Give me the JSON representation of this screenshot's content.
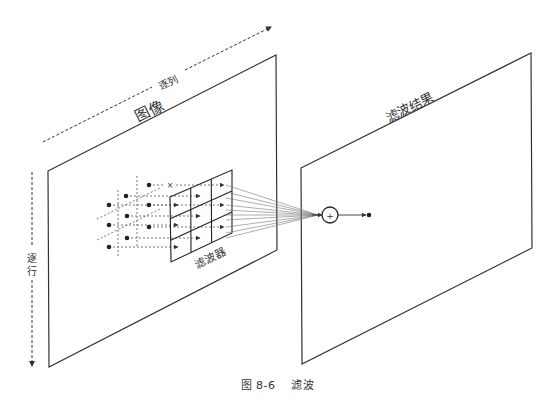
{
  "diagram": {
    "title": "滤波",
    "figure_number": "图 8-6",
    "caption": "图 8-6    滤波",
    "labels": {
      "column_scan": "逐列",
      "row_scan": "逐行",
      "input_plane": "图像",
      "filter": "滤波器",
      "output_plane": "滤波结果",
      "sum_symbol": "+",
      "skipped_marker": "×"
    },
    "nodes": [
      {
        "id": "input-image",
        "label": "图像",
        "type": "plane"
      },
      {
        "id": "filter-kernel",
        "label": "滤波器",
        "type": "grid",
        "rows": 3,
        "cols": 3
      },
      {
        "id": "summation",
        "label": "+",
        "type": "sum-node"
      },
      {
        "id": "output-image",
        "label": "滤波结果",
        "type": "plane"
      }
    ],
    "edges": [
      {
        "from": "input-image",
        "to": "filter-kernel",
        "label": "pixel samples"
      },
      {
        "from": "filter-kernel",
        "to": "summation",
        "label": ""
      },
      {
        "from": "summation",
        "to": "output-image",
        "label": ""
      }
    ],
    "colors": {
      "stroke": "#333333",
      "fan": "#777777",
      "text": "#333333",
      "background": "#ffffff"
    }
  }
}
